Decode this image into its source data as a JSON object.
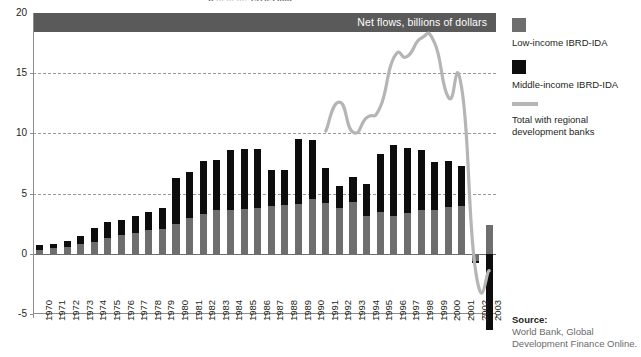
{
  "figure": {
    "clipped_title": "p ... ... ..., 1970-2003",
    "banner_label": "Net flows, billions of dollars"
  },
  "legend": {
    "position": "right",
    "items": [
      {
        "swatch": "low",
        "label": "Low-income IBRD-IDA",
        "color": "#6e6e6e"
      },
      {
        "swatch": "mid",
        "label": "Middle-income IBRD-IDA",
        "color": "#0d0d0d"
      },
      {
        "swatch": "line",
        "label": "Total with regional development banks",
        "color": "#b5b5b5"
      }
    ]
  },
  "source": {
    "heading": "Source:",
    "text": "World Bank, Global Development Finance Online."
  },
  "chart_data": {
    "type": "bar",
    "title": "Net flows, billions of dollars",
    "xlabel": "",
    "ylabel": "",
    "ylim": [
      -5,
      20
    ],
    "yticks": [
      -5,
      0,
      5,
      10,
      15,
      20
    ],
    "ytick_labels": [
      "-5",
      "0",
      "5",
      "10",
      "15",
      "20"
    ],
    "grid": true,
    "gridlines_at": [
      5,
      10,
      15
    ],
    "stacked": true,
    "categories": [
      "1970",
      "1971",
      "1972",
      "1973",
      "1974",
      "1975",
      "1976",
      "1977",
      "1978",
      "1979",
      "1980",
      "1981",
      "1982",
      "1983",
      "1984",
      "1985",
      "1986",
      "1987",
      "1988",
      "1989",
      "1990",
      "1991",
      "1992",
      "1993",
      "1994",
      "1995",
      "1996",
      "1997",
      "1998",
      "1999",
      "2000",
      "2001",
      "2002",
      "2003"
    ],
    "series": [
      {
        "name": "Low-income IBRD-IDA",
        "color": "#6e6e6e",
        "values": [
          0.35,
          0.45,
          0.6,
          0.8,
          0.95,
          1.35,
          1.6,
          1.75,
          2.0,
          2.1,
          2.5,
          3.0,
          3.3,
          3.6,
          3.6,
          3.7,
          3.8,
          4.0,
          4.05,
          4.1,
          4.55,
          4.2,
          3.8,
          4.3,
          3.1,
          3.5,
          3.1,
          3.4,
          3.6,
          3.6,
          3.9,
          4.0,
          -0.6,
          2.4
        ]
      },
      {
        "name": "Middle-income IBRD-IDA",
        "color": "#0d0d0d",
        "values": [
          0.35,
          0.4,
          0.5,
          0.7,
          1.2,
          1.25,
          1.2,
          1.35,
          1.5,
          1.7,
          3.8,
          3.8,
          4.4,
          4.2,
          5.0,
          5.0,
          4.9,
          3.0,
          2.95,
          5.4,
          4.9,
          2.95,
          1.8,
          2.1,
          2.7,
          4.8,
          5.9,
          5.4,
          5.0,
          4.0,
          3.8,
          3.3,
          -0.2,
          -6.3
        ]
      }
    ],
    "line_series": {
      "name": "Total with regional development banks",
      "color": "#b5b5b5",
      "x": [
        "1991",
        "1992",
        "1993",
        "1994",
        "1995",
        "1996",
        "1997",
        "1998",
        "1999",
        "2000",
        "2001",
        "2002",
        "2003"
      ],
      "values": [
        10.2,
        12.6,
        10.1,
        11.3,
        12.2,
        16.3,
        16.4,
        17.9,
        17.5,
        13.0,
        13.6,
        -1.4,
        -1.4
      ]
    }
  }
}
